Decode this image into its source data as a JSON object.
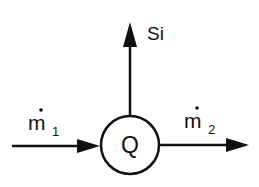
{
  "diagram": {
    "node": {
      "label": "Q",
      "shape": "circle"
    },
    "flows": [
      {
        "id": "inflow",
        "label_main": "m",
        "label_sub": "1",
        "has_dot": true,
        "direction": "into-node"
      },
      {
        "id": "outflow",
        "label_main": "m",
        "label_sub": "2",
        "has_dot": true,
        "direction": "out-of-node"
      },
      {
        "id": "vertical",
        "label_main": "Si",
        "direction": "up"
      }
    ],
    "colors": {
      "stroke": "#111111",
      "background": "#ffffff"
    }
  }
}
